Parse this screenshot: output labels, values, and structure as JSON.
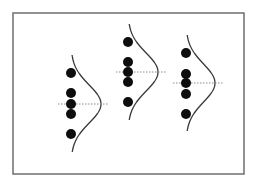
{
  "diagram": {
    "frame": {
      "x": 13,
      "y": 13,
      "width": 231,
      "height": 161,
      "stroke": "#6e6e6e"
    },
    "colors": {
      "dot": "#0d0d0d",
      "curve": "#3a3a3a",
      "mean_line": "#8a8a8a",
      "background": "#ffffff"
    },
    "groups": [
      {
        "name": "group-1",
        "x": 71,
        "points_y": [
          73,
          93,
          104,
          114,
          134
        ],
        "mean_y": 104,
        "curve": {
          "top_y": 55,
          "bottom_y": 152,
          "peak_x": 101,
          "sigma": 19
        },
        "mean_line": {
          "x1": 58,
          "x2": 108
        }
      },
      {
        "name": "group-2",
        "x": 128,
        "points_y": [
          42,
          62,
          72,
          82,
          102
        ],
        "mean_y": 72,
        "curve": {
          "top_y": 24,
          "bottom_y": 120,
          "peak_x": 158,
          "sigma": 19
        },
        "mean_line": {
          "x1": 116,
          "x2": 166
        }
      },
      {
        "name": "group-3",
        "x": 186,
        "points_y": [
          53,
          74,
          83,
          94,
          114
        ],
        "mean_y": 83,
        "curve": {
          "top_y": 35,
          "bottom_y": 131,
          "peak_x": 215,
          "sigma": 19
        },
        "mean_line": {
          "x1": 173,
          "x2": 223
        }
      }
    ],
    "dot_radius": 5
  }
}
